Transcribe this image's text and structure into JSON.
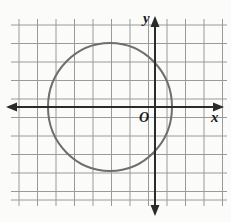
{
  "figure": {
    "kind": "coordinate-plane-with-circle",
    "width": 231,
    "height": 222,
    "background_color": "#fbfbfa"
  },
  "grid": {
    "line_color": "#9a9a9a",
    "line_width": 1,
    "cell_size": 18.5,
    "columns": 11,
    "rows": 10,
    "left": 19,
    "top": 25,
    "right": 223,
    "bottom": 200,
    "vertical_line_x": [
      19,
      37.5,
      56,
      74.5,
      93,
      111.5,
      130,
      148.5,
      167,
      185.5,
      204,
      222.5
    ],
    "horizontal_line_y": [
      25,
      43.5,
      62,
      80.5,
      99,
      117.5,
      136,
      154.5,
      173,
      191.5,
      200
    ]
  },
  "axes": {
    "color": "#2b2b2b",
    "line_width": 2,
    "x_axis": {
      "y": 107,
      "x_start": 8,
      "x_end": 222,
      "arrow_left": true,
      "arrow_right": true,
      "label": "x",
      "label_x": 213,
      "label_y": 119
    },
    "y_axis": {
      "x": 155,
      "y_start": 18,
      "y_end": 214,
      "arrow_up": true,
      "arrow_down": true,
      "label": "y",
      "label_x": 145,
      "label_y": 20
    },
    "origin": {
      "label": "O",
      "label_x": 140,
      "label_y": 121,
      "x": 155,
      "y": 107
    }
  },
  "circle": {
    "stroke_color": "#6e6e6e",
    "stroke_width": 2,
    "fill": "none",
    "center_x": 110,
    "center_y": 107,
    "radius_x": 62,
    "radius_y": 64,
    "left_edge_x": 48,
    "right_edge_x": 172,
    "top_edge_y": 43,
    "bottom_edge_y": 171,
    "center_in_grid_units_x": -2.4,
    "center_in_grid_units_y": 0,
    "radius_in_grid_units": 3.4
  },
  "labels": {
    "x_axis_label": "x",
    "y_axis_label": "y",
    "origin_label": "O"
  }
}
